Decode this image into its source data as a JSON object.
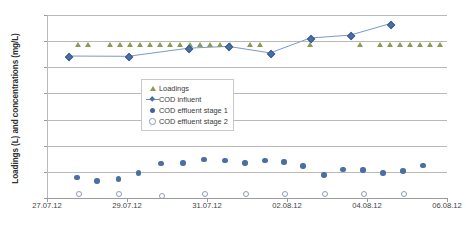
{
  "chart_data": {
    "type": "scatter",
    "title": "",
    "xlabel": "",
    "ylabel": "Loadings (L) and concentrations (mg/L)",
    "ylim": [
      0,
      700
    ],
    "ytick_values": [
      0,
      100,
      200,
      300,
      400,
      500,
      600,
      700
    ],
    "ytick_labels": [
      "0",
      "100",
      "200",
      "300",
      "400",
      "500",
      "600",
      "700"
    ],
    "xlim": [
      "27.07.12",
      "06.08.12"
    ],
    "xtick_labels": [
      "27.07.12",
      "29.07.12",
      "31.07.12",
      "02.08.12",
      "04.08.12",
      "06.08.12"
    ],
    "xtick_days": [
      0,
      2,
      4,
      6,
      8,
      10
    ],
    "grid": "horizontal",
    "legend_position": "center",
    "series": [
      {
        "name": "Loadings",
        "marker": "triangle",
        "color": "#8a9a52",
        "line": false,
        "x_days": [
          0.78,
          1.03,
          1.58,
          1.83,
          2.08,
          2.33,
          2.58,
          2.83,
          3.08,
          3.33,
          3.58,
          3.83,
          4.08,
          4.33,
          4.58,
          5.08,
          5.33,
          6.58,
          7.83,
          8.33,
          8.58,
          8.83,
          9.08,
          9.33,
          9.58,
          9.83
        ],
        "values": [
          578,
          578,
          578,
          578,
          578,
          578,
          578,
          578,
          578,
          578,
          578,
          578,
          578,
          578,
          578,
          578,
          578,
          578,
          578,
          578,
          578,
          578,
          578,
          578,
          578,
          578
        ]
      },
      {
        "name": "COD influent",
        "marker": "diamond",
        "color": "#4a6fa5",
        "line": true,
        "x_days": [
          0.53,
          2.03,
          3.53,
          4.53,
          5.58,
          6.58,
          7.58,
          8.58
        ],
        "values": [
          543,
          542,
          573,
          580,
          555,
          612,
          623,
          667
        ]
      },
      {
        "name": "COD effluent stage 1",
        "marker": "circle-filled",
        "color": "#4a6fa5",
        "line": false,
        "x_days": [
          0.75,
          1.25,
          1.78,
          2.28,
          2.85,
          3.4,
          3.92,
          4.45,
          4.95,
          5.45,
          5.92,
          6.4,
          6.92,
          7.4,
          7.9,
          8.4,
          8.9,
          9.4
        ],
        "values": [
          78,
          65,
          73,
          96,
          131,
          134,
          147,
          143,
          134,
          144,
          137,
          123,
          88,
          110,
          107,
          95,
          103,
          124
        ]
      },
      {
        "name": "COD effluent stage 2",
        "marker": "circle-open",
        "color": "#8e9cb4",
        "line": false,
        "x_days": [
          0.78,
          1.78,
          2.85,
          3.92,
          4.95,
          5.92,
          6.92,
          7.9,
          8.9
        ],
        "values": [
          18,
          20,
          12,
          18,
          20,
          18,
          20,
          18,
          20
        ]
      }
    ]
  },
  "legend": {
    "items": [
      {
        "label": "Loadings",
        "key": "triangle-marker-icon"
      },
      {
        "label": "COD influent",
        "key": "diamond-line-marker-icon"
      },
      {
        "label": "COD effluent stage 1",
        "key": "filled-circle-marker-icon"
      },
      {
        "label": "COD effluent stage 2",
        "key": "open-circle-marker-icon"
      }
    ]
  },
  "colors": {
    "loadings": "#8a9a52",
    "influent": "#4a6fa5",
    "effluent_stage1": "#4a6fa5",
    "effluent_stage2": "#8e9cb4",
    "gridline": "#b9b9b9",
    "axis": "#9a9a9a",
    "background": "#ffffff"
  }
}
